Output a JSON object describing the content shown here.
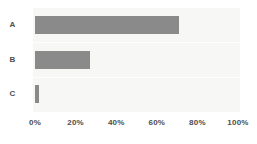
{
  "chart_data": {
    "type": "bar",
    "orientation": "horizontal",
    "title": "",
    "subtitle": "",
    "xlabel": "",
    "ylabel": "",
    "categories": [
      "A",
      "B",
      "C"
    ],
    "values": [
      71,
      27,
      2
    ],
    "series": [
      {
        "name": "",
        "values": [
          71,
          27,
          2
        ],
        "color": "#8a8a8a"
      }
    ],
    "xlim": [
      0,
      100
    ],
    "xticks": [
      0,
      20,
      40,
      60,
      80,
      100
    ],
    "xtick_labels": [
      "0%",
      "20%",
      "40%",
      "60%",
      "80%",
      "100%"
    ],
    "ytick_labels": [
      "A",
      "B",
      "C"
    ],
    "value_format": "percent",
    "grid": true,
    "grid_axis": "y",
    "legend": false,
    "legend_position": "none",
    "annotations": []
  },
  "style": {
    "bar_color": "#8a8a8a",
    "plot_background": "#f7f7f5",
    "page_background": "#ffffff",
    "gridline_color": "#ffffff",
    "tick_label_color": "#4d4d4d"
  }
}
